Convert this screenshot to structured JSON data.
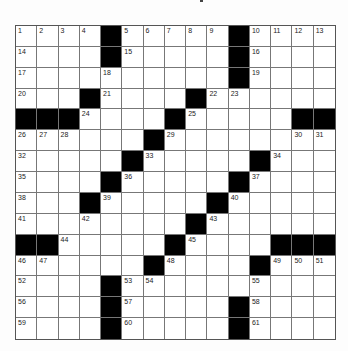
{
  "puzzle": {
    "rows": 15,
    "cols": 15,
    "colors": {
      "black_square": "#000000",
      "white_square": "#ffffff",
      "grid_line": "#777777"
    },
    "blacks": [
      [
        0,
        4
      ],
      [
        0,
        10
      ],
      [
        1,
        4
      ],
      [
        1,
        10
      ],
      [
        2,
        10
      ],
      [
        3,
        3
      ],
      [
        3,
        8
      ],
      [
        4,
        0
      ],
      [
        4,
        1
      ],
      [
        4,
        2
      ],
      [
        4,
        7
      ],
      [
        4,
        13
      ],
      [
        4,
        14
      ],
      [
        5,
        6
      ],
      [
        6,
        5
      ],
      [
        6,
        11
      ],
      [
        7,
        4
      ],
      [
        7,
        10
      ],
      [
        8,
        3
      ],
      [
        8,
        9
      ],
      [
        9,
        8
      ],
      [
        10,
        0
      ],
      [
        10,
        1
      ],
      [
        10,
        7
      ],
      [
        10,
        12
      ],
      [
        10,
        13
      ],
      [
        10,
        14
      ],
      [
        11,
        6
      ],
      [
        11,
        11
      ],
      [
        12,
        4
      ],
      [
        13,
        4
      ],
      [
        13,
        10
      ],
      [
        14,
        4
      ],
      [
        14,
        10
      ]
    ],
    "numbers": [
      {
        "r": 0,
        "c": 0,
        "n": "1"
      },
      {
        "r": 0,
        "c": 1,
        "n": "2"
      },
      {
        "r": 0,
        "c": 2,
        "n": "3"
      },
      {
        "r": 0,
        "c": 3,
        "n": "4"
      },
      {
        "r": 0,
        "c": 5,
        "n": "5"
      },
      {
        "r": 0,
        "c": 6,
        "n": "6"
      },
      {
        "r": 0,
        "c": 7,
        "n": "7"
      },
      {
        "r": 0,
        "c": 8,
        "n": "8"
      },
      {
        "r": 0,
        "c": 9,
        "n": "9"
      },
      {
        "r": 0,
        "c": 11,
        "n": "10"
      },
      {
        "r": 0,
        "c": 12,
        "n": "11"
      },
      {
        "r": 0,
        "c": 13,
        "n": "12"
      },
      {
        "r": 0,
        "c": 14,
        "n": "13"
      },
      {
        "r": 1,
        "c": 0,
        "n": "14"
      },
      {
        "r": 1,
        "c": 5,
        "n": "15"
      },
      {
        "r": 1,
        "c": 11,
        "n": "16"
      },
      {
        "r": 2,
        "c": 0,
        "n": "17"
      },
      {
        "r": 2,
        "c": 4,
        "n": "18"
      },
      {
        "r": 2,
        "c": 11,
        "n": "19"
      },
      {
        "r": 3,
        "c": 0,
        "n": "20"
      },
      {
        "r": 3,
        "c": 4,
        "n": "21"
      },
      {
        "r": 3,
        "c": 9,
        "n": "22"
      },
      {
        "r": 3,
        "c": 10,
        "n": "23"
      },
      {
        "r": 4,
        "c": 3,
        "n": "24"
      },
      {
        "r": 4,
        "c": 8,
        "n": "25"
      },
      {
        "r": 5,
        "c": 0,
        "n": "26"
      },
      {
        "r": 5,
        "c": 1,
        "n": "27"
      },
      {
        "r": 5,
        "c": 2,
        "n": "28"
      },
      {
        "r": 5,
        "c": 7,
        "n": "29"
      },
      {
        "r": 5,
        "c": 13,
        "n": "30"
      },
      {
        "r": 5,
        "c": 14,
        "n": "31"
      },
      {
        "r": 6,
        "c": 0,
        "n": "32"
      },
      {
        "r": 6,
        "c": 6,
        "n": "33"
      },
      {
        "r": 6,
        "c": 12,
        "n": "34"
      },
      {
        "r": 7,
        "c": 0,
        "n": "35"
      },
      {
        "r": 7,
        "c": 5,
        "n": "36"
      },
      {
        "r": 7,
        "c": 11,
        "n": "37"
      },
      {
        "r": 8,
        "c": 0,
        "n": "38"
      },
      {
        "r": 8,
        "c": 4,
        "n": "39"
      },
      {
        "r": 8,
        "c": 10,
        "n": "40"
      },
      {
        "r": 9,
        "c": 0,
        "n": "41"
      },
      {
        "r": 9,
        "c": 3,
        "n": "42"
      },
      {
        "r": 9,
        "c": 9,
        "n": "43"
      },
      {
        "r": 10,
        "c": 2,
        "n": "44"
      },
      {
        "r": 10,
        "c": 8,
        "n": "45"
      },
      {
        "r": 11,
        "c": 0,
        "n": "46"
      },
      {
        "r": 11,
        "c": 1,
        "n": "47"
      },
      {
        "r": 11,
        "c": 7,
        "n": "48"
      },
      {
        "r": 11,
        "c": 12,
        "n": "49"
      },
      {
        "r": 11,
        "c": 13,
        "n": "50"
      },
      {
        "r": 11,
        "c": 14,
        "n": "51"
      },
      {
        "r": 12,
        "c": 0,
        "n": "52"
      },
      {
        "r": 12,
        "c": 5,
        "n": "53"
      },
      {
        "r": 12,
        "c": 6,
        "n": "54"
      },
      {
        "r": 12,
        "c": 11,
        "n": "55"
      },
      {
        "r": 13,
        "c": 0,
        "n": "56"
      },
      {
        "r": 13,
        "c": 5,
        "n": "57"
      },
      {
        "r": 13,
        "c": 11,
        "n": "58"
      },
      {
        "r": 14,
        "c": 0,
        "n": "59"
      },
      {
        "r": 14,
        "c": 5,
        "n": "60"
      },
      {
        "r": 14,
        "c": 11,
        "n": "61"
      }
    ]
  }
}
